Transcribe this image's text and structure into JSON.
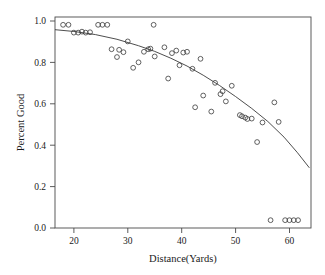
{
  "chart_data": {
    "type": "scatter",
    "title": "",
    "xlabel": "Distance(Yards)",
    "ylabel": "Percent Good",
    "xlim": [
      16.5,
      64.0
    ],
    "ylim": [
      -0.04,
      1.04
    ],
    "grid": false,
    "legend": null,
    "xticks": [
      20,
      30,
      40,
      50,
      60
    ],
    "xtick_labels": [
      "20",
      "30",
      "40",
      "50",
      "60"
    ],
    "yticks": [
      0.0,
      0.2,
      0.4,
      0.6,
      0.8,
      1.0
    ],
    "ytick_labels": [
      "0.0",
      "0.2",
      "0.4",
      "0.6",
      "0.8",
      "1.0"
    ],
    "marker": "open-circle",
    "marker_color": "#3a3a3a",
    "curve_color": "#3a3a3a",
    "series": [
      {
        "name": "observed",
        "x": [
          18.0,
          19.0,
          20.0,
          20.8,
          21.5,
          22.2,
          23.0,
          24.5,
          25.3,
          26.2,
          27.0,
          28.0,
          28.4,
          29.2,
          30.0,
          31.0,
          32.0,
          33.0,
          33.8,
          34.2,
          34.8,
          35.0,
          36.8,
          37.5,
          38.2,
          39.0,
          39.6,
          40.3,
          41.0,
          42.0,
          42.5,
          43.5,
          44.0,
          45.5,
          46.2,
          47.2,
          47.6,
          48.2,
          49.3,
          50.8,
          51.2,
          51.8,
          52.2,
          53.0,
          54.0,
          55.0,
          56.5,
          57.2,
          58.0,
          59.2,
          60.0,
          60.8,
          61.6
        ],
        "y": [
          1.0,
          1.0,
          0.96,
          0.96,
          0.965,
          0.96,
          0.962,
          1.0,
          1.0,
          1.0,
          0.875,
          0.835,
          0.872,
          0.86,
          0.915,
          0.78,
          0.808,
          0.862,
          0.875,
          0.878,
          1.0,
          0.838,
          0.885,
          0.725,
          0.855,
          0.868,
          0.793,
          0.858,
          0.862,
          0.775,
          0.578,
          0.826,
          0.638,
          0.556,
          0.703,
          0.645,
          0.66,
          0.608,
          0.688,
          0.538,
          0.532,
          0.525,
          0.518,
          0.52,
          0.4,
          0.5,
          0.0,
          0.603,
          0.503,
          0.0,
          0.0,
          0.0,
          0.0
        ]
      },
      {
        "name": "fitted-curve",
        "type": "line",
        "x": [
          16.5,
          20.0,
          24.0,
          28.0,
          32.0,
          35.0,
          38.0,
          41.0,
          44.0,
          47.0,
          50.0,
          53.0,
          56.0,
          59.0,
          61.5,
          63.7
        ],
        "y": [
          0.975,
          0.966,
          0.95,
          0.926,
          0.893,
          0.864,
          0.829,
          0.789,
          0.742,
          0.69,
          0.633,
          0.572,
          0.505,
          0.425,
          0.345,
          0.268
        ]
      }
    ]
  }
}
